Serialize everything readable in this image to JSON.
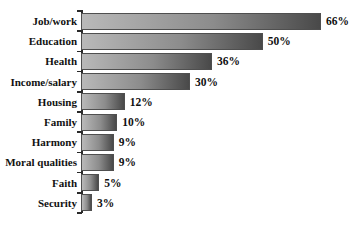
{
  "chart_data": {
    "type": "bar",
    "orientation": "horizontal",
    "title": "",
    "xlabel": "",
    "ylabel": "",
    "categories": [
      "Job/work",
      "Education",
      "Health",
      "Income/salary",
      "Housing",
      "Family",
      "Harmony",
      "Moral qualities",
      "Faith",
      "Security"
    ],
    "values": [
      66,
      50,
      36,
      30,
      12,
      10,
      9,
      9,
      5,
      3
    ],
    "value_labels": [
      "66%",
      "50%",
      "36%",
      "30%",
      "12%",
      "10%",
      "9%",
      "9%",
      "5%",
      "3%"
    ],
    "max_value": 66,
    "grid": false,
    "legend": false,
    "bar_gradient_start": "#b9b9b9",
    "bar_gradient_end": "#494949",
    "axis_color": "#2a2a2a",
    "text_color": "#111111",
    "background": "#ffffff"
  }
}
